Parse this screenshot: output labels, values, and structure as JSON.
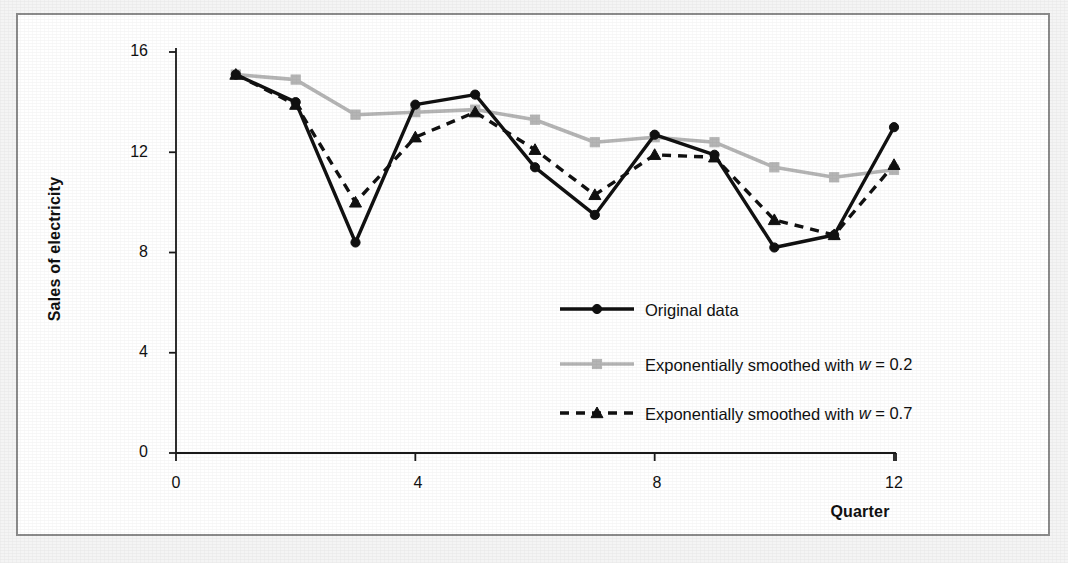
{
  "chart_data": {
    "type": "line",
    "title": "",
    "xlabel": "Quarter",
    "ylabel": "Sales of electricity",
    "xlim": [
      0,
      12
    ],
    "ylim": [
      0,
      16
    ],
    "xticks": [
      "0",
      "4",
      "8",
      "12"
    ],
    "yticks": [
      "0",
      "4",
      "8",
      "12",
      "16"
    ],
    "grid": false,
    "legend_position": "inside-lower-center",
    "x": [
      1,
      2,
      3,
      4,
      5,
      6,
      7,
      8,
      9,
      10,
      11,
      12
    ],
    "series": [
      {
        "name": "Original data",
        "color": "#111111",
        "marker": "circle",
        "dash": "solid",
        "values": [
          15.1,
          14.0,
          8.4,
          13.9,
          14.3,
          11.4,
          9.5,
          12.7,
          11.9,
          8.2,
          8.7,
          13.0
        ]
      },
      {
        "name": "Exponentially smoothed with w = 0.2",
        "color": "#b5b5b5",
        "marker": "square",
        "dash": "solid",
        "values": [
          15.1,
          14.9,
          13.5,
          13.6,
          13.7,
          13.3,
          12.4,
          12.6,
          12.4,
          11.4,
          11.0,
          11.3
        ]
      },
      {
        "name": "Exponentially smoothed with w = 0.7",
        "color": "#111111",
        "marker": "triangle",
        "dash": "dashed",
        "values": [
          15.1,
          13.9,
          10.0,
          12.6,
          13.6,
          12.1,
          10.3,
          11.9,
          11.8,
          9.3,
          8.7,
          11.5
        ]
      }
    ]
  },
  "axes": {
    "y_label": "Sales of electricity",
    "x_label": "Quarter",
    "y_ticks": [
      {
        "value": 16,
        "label": "16"
      },
      {
        "value": 12,
        "label": "12"
      },
      {
        "value": 8,
        "label": "8"
      },
      {
        "value": 4,
        "label": "4"
      },
      {
        "value": 0,
        "label": "0"
      }
    ],
    "x_ticks": [
      {
        "value": 0,
        "label": "0"
      },
      {
        "value": 4,
        "label": "4"
      },
      {
        "value": 8,
        "label": "8"
      },
      {
        "value": 12,
        "label": "12"
      }
    ]
  },
  "legend": {
    "items": [
      {
        "label_plain": "Original data",
        "label_pre": "Original data",
        "label_var": "",
        "label_post": ""
      },
      {
        "label_plain": "Exponentially smoothed with w = 0.2",
        "label_pre": "Exponentially smoothed with ",
        "label_var": "w",
        "label_post": " = 0.2"
      },
      {
        "label_plain": "Exponentially smoothed with w = 0.7",
        "label_pre": "Exponentially smoothed with ",
        "label_var": "w",
        "label_post": " = 0.7"
      }
    ]
  },
  "colors": {
    "series_black": "#111111",
    "series_gray": "#b5b5b5",
    "frame_border": "#8c8c8c",
    "page_background": "#f2f2f2",
    "plot_background": "#ffffff"
  }
}
